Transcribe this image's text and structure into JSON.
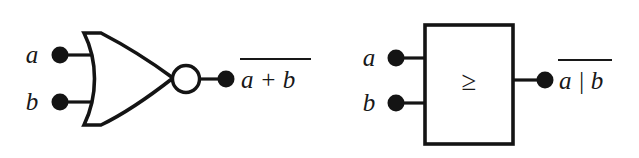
{
  "figure": {
    "background_color": "#ffffff",
    "line_color": "#141414",
    "text_color": "#181818"
  },
  "gates": [
    {
      "id": "nor-distinctive",
      "style_name": "distinctive-shape-nor-gate",
      "shape": "or-curved-body-with-inversion-bubble",
      "inputs": [
        {
          "name": "input-a",
          "label": "a"
        },
        {
          "name": "input-b",
          "label": "b"
        }
      ],
      "output": {
        "name": "output-nor-plus",
        "expression": "a + b",
        "overbar": true,
        "operator": "+"
      },
      "has_inversion_bubble": true
    },
    {
      "id": "nor-rectangular",
      "style_name": "rectangular-iec-nor-gate",
      "shape": "rectangle-with-threshold-symbol",
      "body_symbol": "≥",
      "inputs": [
        {
          "name": "input-a",
          "label": "a"
        },
        {
          "name": "input-b",
          "label": "b"
        }
      ],
      "output": {
        "name": "output-nor-bar",
        "expression": "a | b",
        "overbar": true,
        "operator": "|"
      },
      "has_inversion_bubble": false
    }
  ]
}
